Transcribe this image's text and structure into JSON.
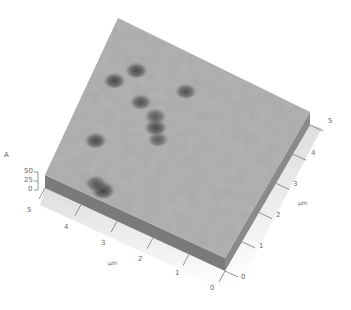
{
  "chart_data": {
    "type": "surface3d",
    "title": "",
    "x_axis": {
      "label": "µm",
      "ticks": [
        "0",
        "1",
        "2",
        "3",
        "4",
        "5"
      ],
      "range": [
        0,
        5
      ]
    },
    "y_axis": {
      "label": "µm",
      "ticks": [
        "0",
        "1",
        "2",
        "3",
        "4",
        "5"
      ],
      "range": [
        0,
        5
      ]
    },
    "z_axis": {
      "label": "A",
      "ticks": [
        "0",
        "25",
        "50"
      ],
      "range": [
        0,
        50
      ]
    },
    "surface_color": "#a9a9a9",
    "side_wall_color": "#7c7c7c",
    "pits": [
      {
        "x_um": 0.35,
        "y_um": 3.55,
        "depth_rel": 1.0,
        "radius_rel": 0.22
      },
      {
        "x_um": 0.45,
        "y_um": 3.8,
        "depth_rel": 0.6,
        "radius_rel": 0.17
      },
      {
        "x_um": 1.6,
        "y_um": 4.35,
        "depth_rel": 0.85,
        "radius_rel": 0.17
      },
      {
        "x_um": 2.4,
        "y_um": 3.0,
        "depth_rel": 0.55,
        "radius_rel": 0.13
      },
      {
        "x_um": 3.45,
        "y_um": 4.7,
        "depth_rel": 0.9,
        "radius_rel": 0.17
      },
      {
        "x_um": 3.2,
        "y_um": 3.85,
        "depth_rel": 0.75,
        "radius_rel": 0.15
      },
      {
        "x_um": 2.7,
        "y_um": 3.2,
        "depth_rel": 0.85,
        "radius_rel": 0.18
      },
      {
        "x_um": 3.0,
        "y_um": 3.35,
        "depth_rel": 0.6,
        "radius_rel": 0.15
      },
      {
        "x_um": 4.0,
        "y_um": 4.35,
        "depth_rel": 0.85,
        "radius_rel": 0.17
      },
      {
        "x_um": 4.05,
        "y_um": 3.0,
        "depth_rel": 0.75,
        "radius_rel": 0.15
      }
    ]
  },
  "labels": {
    "z_unit": "A",
    "z_ticks": [
      "50",
      "25",
      "0"
    ],
    "left_ticks": [
      "5",
      "4",
      "3",
      "2",
      "1",
      "0"
    ],
    "left_unit": "µm",
    "right_ticks": [
      "0",
      "1",
      "2",
      "3",
      "4",
      "5"
    ],
    "right_unit": "µm"
  }
}
